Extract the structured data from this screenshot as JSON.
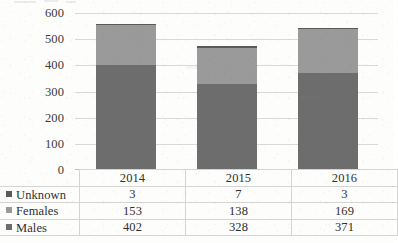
{
  "chart_data": {
    "type": "bar",
    "subtype": "stacked-bar-with-data-table",
    "title": "",
    "xlabel": "",
    "ylabel": "",
    "categories": [
      "2014",
      "2015",
      "2016"
    ],
    "series": [
      {
        "name": "Males",
        "values": [
          402,
          328,
          371
        ],
        "color": "#6d6d6d",
        "stack_order": 1
      },
      {
        "name": "Females",
        "values": [
          153,
          138,
          169
        ],
        "color": "#9a9a9a",
        "stack_order": 2
      },
      {
        "name": "Unknown",
        "values": [
          3,
          7,
          3
        ],
        "color": "#5a5a5a",
        "stack_order": 3
      }
    ],
    "totals": [
      558,
      473,
      543
    ],
    "ylim": [
      0,
      600
    ],
    "ytick_step": 100,
    "yticks": [
      "600",
      "500",
      "400",
      "300",
      "200",
      "100",
      "0"
    ],
    "grid": true,
    "legend_position": "data-table-row-labels",
    "has_data_table": true
  },
  "axis": {
    "y_ticks": [
      "600",
      "500",
      "400",
      "300",
      "200",
      "100",
      "0"
    ]
  },
  "table": {
    "column_headers": [
      "2014",
      "2015",
      "2016"
    ],
    "rows": [
      {
        "label": "Unknown",
        "marker": "legend-swatch-unknown",
        "values": [
          "3",
          "7",
          "3"
        ]
      },
      {
        "label": "Females",
        "marker": "legend-swatch-females",
        "values": [
          "153",
          "138",
          "169"
        ]
      },
      {
        "label": "Males",
        "marker": "legend-swatch-males",
        "values": [
          "402",
          "328",
          "371"
        ]
      }
    ]
  },
  "colors": {
    "unknown": "#5a5a5a",
    "females": "#9a9a9a",
    "males": "#6d6d6d",
    "gridline": "#d9d9d9",
    "table_border": "#d4d4d4",
    "background": "#fdfdfc"
  }
}
